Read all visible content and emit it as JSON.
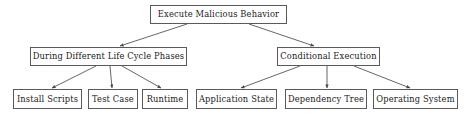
{
  "diagram": {
    "type": "tree",
    "orientation": "top-down",
    "colors": {
      "box_border": "#5a5a5a",
      "text": "#1a1a1a",
      "edge": "#4a4a4a",
      "background": "#ffffff"
    },
    "nodes": {
      "root": {
        "label": "Execute Malicious Behavior"
      },
      "branch_left": {
        "label": "During Different Life Cycle Phases"
      },
      "branch_right": {
        "label": "Conditional Execution"
      },
      "leaf_install_scripts": {
        "label": "Install Scripts"
      },
      "leaf_test_case": {
        "label": "Test Case"
      },
      "leaf_runtime": {
        "label": "Runtime"
      },
      "leaf_application_state": {
        "label": "Application State"
      },
      "leaf_dependency_tree": {
        "label": "Dependency Tree"
      },
      "leaf_operating_system": {
        "label": "Operating System"
      }
    },
    "edges": [
      {
        "from": "root",
        "to": "branch_left"
      },
      {
        "from": "root",
        "to": "branch_right"
      },
      {
        "from": "branch_left",
        "to": "leaf_install_scripts"
      },
      {
        "from": "branch_left",
        "to": "leaf_test_case"
      },
      {
        "from": "branch_left",
        "to": "leaf_runtime"
      },
      {
        "from": "branch_right",
        "to": "leaf_application_state"
      },
      {
        "from": "branch_right",
        "to": "leaf_dependency_tree"
      },
      {
        "from": "branch_right",
        "to": "leaf_operating_system"
      }
    ]
  }
}
